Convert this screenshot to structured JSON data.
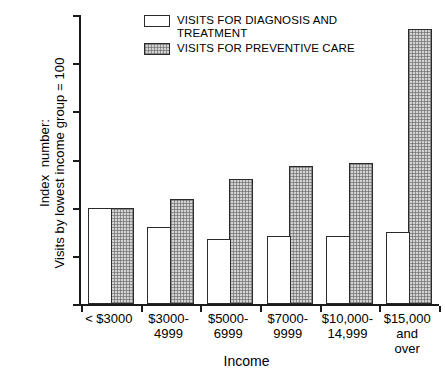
{
  "chart_data": {
    "type": "bar",
    "title": "",
    "xlabel": "Income",
    "ylabel": "Index  number:\nVisits by lowest income group = 100",
    "categories": [
      "< $3000",
      "$3000-\n4999",
      "$5000-\n6999",
      "$7000-\n9999",
      "$10,000-\n14,999",
      "$15,000\nand\nover"
    ],
    "series": [
      {
        "name": "VISITS FOR DIAGNOSIS  AND\n    TREATMENT",
        "pattern": "plain",
        "values": [
          100,
          80,
          68,
          71,
          71,
          75
        ]
      },
      {
        "name": "VISITS FOR PREVENTIVE CARE",
        "pattern": "hatch",
        "values": [
          100,
          109,
          130,
          143,
          146,
          285
        ]
      }
    ],
    "ylim": [
      0,
      300
    ],
    "yticks": [
      0,
      50,
      100,
      150,
      200,
      250,
      300
    ],
    "ytick_labels": [
      "0",
      "50",
      "100",
      "150",
      "200",
      "250",
      "300"
    ],
    "grid": false,
    "legend_position": "top-center",
    "colors": {
      "plain_fill": "#ffffff",
      "hatch_fill": "#d2d2d2",
      "outline": "#2b2b2b",
      "axis": "#1a1a1a",
      "text": "#000000",
      "background": "#ffffff"
    }
  }
}
